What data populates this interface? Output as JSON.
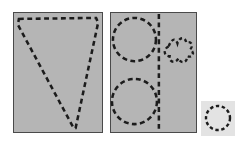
{
  "figure": {
    "title": "",
    "canvas": {
      "width": 241,
      "height": 147,
      "background": "#ffffff"
    },
    "colors": {
      "panel_fill": "#b5b5b5",
      "panel_border": "#4a4a4a",
      "dash_stroke": "#1c1c1c",
      "small_panel_fill": "#e3e3e3"
    },
    "panels": [
      {
        "id": "panel-left",
        "label": "",
        "x": 13,
        "y": 12,
        "width": 90,
        "height": 121,
        "fill": "#b5b5b5",
        "border": "#4a4a4a",
        "shapes": [
          {
            "name": "cone-outline",
            "type": "polygon",
            "dashed": true,
            "points": "5,6 84,5 86,10 63,117 61,117 4,12"
          }
        ]
      },
      {
        "id": "panel-middle",
        "label": "",
        "x": 110,
        "y": 12,
        "width": 87,
        "height": 121,
        "fill": "#b5b5b5",
        "border": "#4a4a4a",
        "shapes": [
          {
            "name": "upper-circle",
            "type": "circle",
            "dashed": true,
            "cx": 24,
            "cy": 27,
            "r": 22
          },
          {
            "name": "lower-circle",
            "type": "circle",
            "dashed": true,
            "cx": 24,
            "cy": 90,
            "r": 23
          },
          {
            "name": "vertical-divider",
            "type": "line",
            "dashed": true,
            "x1": 49,
            "y1": 1,
            "x2": 49,
            "y2": 120
          },
          {
            "name": "flower-squiggle",
            "type": "path",
            "dashed": true,
            "d": "M59,34 C62,26 66,25 68,31 C70,24 76,24 77,30 C82,28 85,33 81,37 C86,40 84,46 78,44 C78,51 71,52 69,46 C66,52 59,50 60,44 C54,44 53,37 59,34 Z"
          }
        ]
      },
      {
        "id": "panel-small",
        "label": "",
        "x": 201,
        "y": 101,
        "width": 34,
        "height": 35,
        "fill": "#e3e3e3",
        "border": "none",
        "shapes": [
          {
            "name": "small-circle",
            "type": "circle",
            "dashed": true,
            "cx": 17,
            "cy": 17,
            "r": 12
          }
        ]
      }
    ]
  }
}
